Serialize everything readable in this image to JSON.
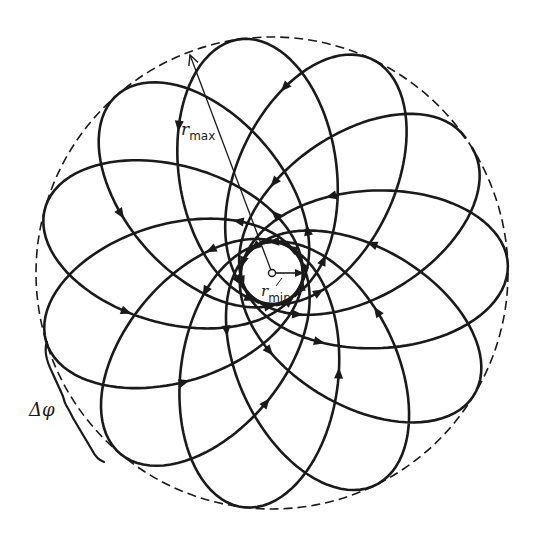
{
  "figure": {
    "type": "rosette-orbit-diagram",
    "background": "#ffffff",
    "ink_color": "#1a1a1a",
    "center": [
      272,
      273
    ],
    "outer_circle": {
      "radius": 236,
      "style": "dashed",
      "meaning": "r_max boundary"
    },
    "inner_circle": {
      "radius": 31,
      "style": "solid",
      "meaning": "r_min boundary"
    },
    "orbit": {
      "loops": 11,
      "precession_deg_per_loop": 33,
      "start_angle_deg": 35,
      "direction": "counterclockwise arrows on trajectory",
      "stroke_width": 2.6
    }
  },
  "labels": {
    "r_max": {
      "base": "r",
      "sub": "max"
    },
    "r_min": {
      "base": "r",
      "sub": "min"
    },
    "delta_phi": "Δφ"
  },
  "annotations": {
    "r_max_arrow": {
      "from": [
        272,
        273
      ],
      "to": [
        190,
        55
      ]
    },
    "r_min_arrow": {
      "from": [
        272,
        273
      ],
      "to": [
        303,
        273
      ]
    },
    "delta_phi_brace": {
      "label_pos": [
        30,
        412
      ]
    }
  }
}
